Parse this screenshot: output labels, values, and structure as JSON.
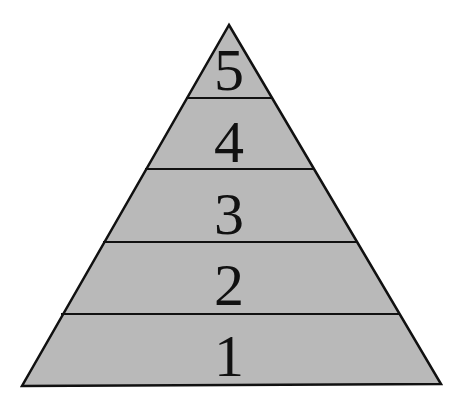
{
  "diagram": {
    "type": "pyramid",
    "fill_color": "#b9b9b9",
    "stroke_color": "#111111",
    "tiers_top_to_bottom": [
      {
        "label": "5",
        "level": 5
      },
      {
        "label": "4",
        "level": 4
      },
      {
        "label": "3",
        "level": 3
      },
      {
        "label": "2",
        "level": 2
      },
      {
        "label": "1",
        "level": 1
      }
    ]
  }
}
